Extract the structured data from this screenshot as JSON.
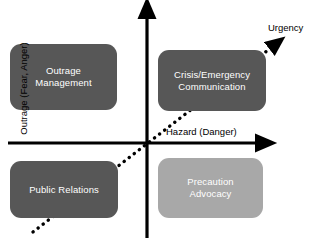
{
  "diagram": {
    "background_color": "#ffffff",
    "box_dark_color": "#575757",
    "box_light_color": "#a8a8a8",
    "axis_color": "#000000",
    "box_text_color": "#ffffff"
  },
  "axes": {
    "vertical": {
      "label": "Outrage (Fear, Anger)",
      "direction": "up",
      "arrowhead": "arrow-up-icon"
    },
    "horizontal": {
      "label": "Hazard (Danger)",
      "direction": "right",
      "arrowhead": "arrow-right-icon"
    },
    "diagonal": {
      "label": "Urgency",
      "direction": "up-right",
      "style": "dotted",
      "arrowhead": "arrow-diagonal-icon"
    }
  },
  "quadrants": [
    {
      "id": "outrage-management",
      "label": "Outrage\nManagement",
      "line1": "Outrage",
      "line2": "Management",
      "position": "top-left",
      "hazard": "low",
      "outrage": "high",
      "fill": "#575757"
    },
    {
      "id": "crisis-emergency",
      "label": "Crisis/Emergency\nCommunication",
      "line1": "Crisis/Emergency",
      "line2": "Communication",
      "position": "top-right",
      "hazard": "high",
      "outrage": "high",
      "fill": "#575757"
    },
    {
      "id": "public-relations",
      "label": "Public Relations",
      "line1": "Public Relations",
      "line2": "",
      "position": "bottom-left",
      "hazard": "low",
      "outrage": "low",
      "fill": "#575757"
    },
    {
      "id": "precaution-advocacy",
      "label": "Precaution\nAdvocacy",
      "line1": "Precaution",
      "line2": "Advocacy",
      "position": "bottom-right",
      "hazard": "high",
      "outrage": "low",
      "fill": "#a8a8a8"
    }
  ]
}
